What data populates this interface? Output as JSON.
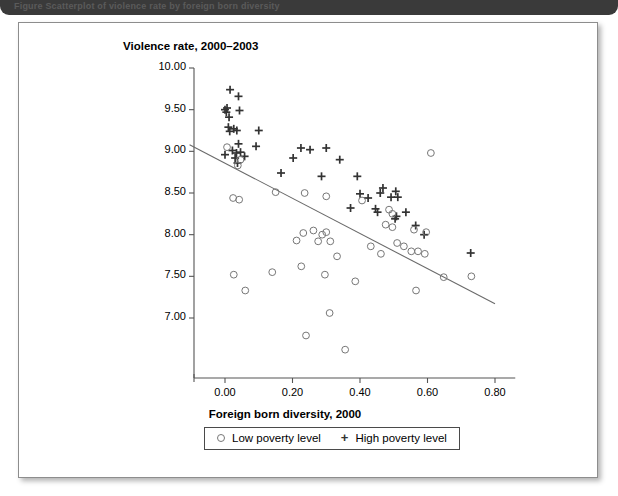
{
  "banner": {
    "caption": "Figure   Scatterplot of violence rate by foreign born diversity"
  },
  "chart_data": {
    "type": "scatter",
    "title": "",
    "ylabel": "Violence rate, 2000–2003",
    "xlabel": "Foreign born diversity, 2000",
    "xlim": [
      -0.1,
      0.9
    ],
    "ylim": [
      6.6,
      10.0
    ],
    "xticks": [
      "0.00",
      "0.20",
      "0.40",
      "0.60",
      "0.80"
    ],
    "xtick_values": [
      0.0,
      0.2,
      0.4,
      0.6,
      0.8
    ],
    "yticks": [
      "10.00",
      "9.50",
      "9.00",
      "8.50",
      "8.00",
      "7.50",
      "7.00"
    ],
    "ytick_values": [
      10.0,
      9.5,
      9.0,
      8.5,
      8.0,
      7.5,
      7.0
    ],
    "grid": false,
    "legend_position": "bottom",
    "trendline": {
      "label": "fitted regression line",
      "x1": -0.105,
      "y1": 9.08,
      "x2": 0.8,
      "y2": 7.17
    },
    "series": [
      {
        "name": "High poverty level",
        "marker": "plus",
        "color": "#333333",
        "points": [
          [
            0.015,
            9.74
          ],
          [
            0.04,
            9.66
          ],
          [
            0.0,
            9.5
          ],
          [
            0.006,
            9.52
          ],
          [
            0.004,
            9.47
          ],
          [
            0.043,
            9.49
          ],
          [
            0.012,
            9.41
          ],
          [
            0.01,
            9.29
          ],
          [
            0.014,
            9.24
          ],
          [
            0.026,
            9.27
          ],
          [
            0.035,
            9.25
          ],
          [
            0.1,
            9.25
          ],
          [
            0.04,
            9.09
          ],
          [
            0.092,
            9.06
          ],
          [
            0.0,
            8.96
          ],
          [
            0.022,
            9.01
          ],
          [
            0.034,
            8.98
          ],
          [
            0.046,
            8.99
          ],
          [
            0.03,
            8.92
          ],
          [
            0.058,
            8.94
          ],
          [
            0.037,
            8.86
          ],
          [
            0.225,
            9.04
          ],
          [
            0.252,
            9.02
          ],
          [
            0.3,
            9.04
          ],
          [
            0.202,
            8.92
          ],
          [
            0.34,
            8.9
          ],
          [
            0.166,
            8.74
          ],
          [
            0.286,
            8.7
          ],
          [
            0.392,
            8.7
          ],
          [
            0.4,
            8.49
          ],
          [
            0.46,
            8.5
          ],
          [
            0.468,
            8.56
          ],
          [
            0.506,
            8.52
          ],
          [
            0.424,
            8.44
          ],
          [
            0.492,
            8.45
          ],
          [
            0.512,
            8.45
          ],
          [
            0.372,
            8.32
          ],
          [
            0.446,
            8.31
          ],
          [
            0.452,
            8.27
          ],
          [
            0.508,
            8.22
          ],
          [
            0.504,
            8.19
          ],
          [
            0.536,
            8.27
          ],
          [
            0.565,
            8.11
          ],
          [
            0.59,
            8.0
          ],
          [
            0.728,
            7.78
          ]
        ]
      },
      {
        "name": "Low poverty level",
        "marker": "circle",
        "color": "#777777",
        "points": [
          [
            0.006,
            9.05
          ],
          [
            0.046,
            8.9
          ],
          [
            0.038,
            8.83
          ],
          [
            0.61,
            8.98
          ],
          [
            0.024,
            8.44
          ],
          [
            0.042,
            8.42
          ],
          [
            0.15,
            8.51
          ],
          [
            0.236,
            8.5
          ],
          [
            0.3,
            8.46
          ],
          [
            0.406,
            8.41
          ],
          [
            0.486,
            8.3
          ],
          [
            0.496,
            8.25
          ],
          [
            0.232,
            8.02
          ],
          [
            0.262,
            8.05
          ],
          [
            0.288,
            8.0
          ],
          [
            0.3,
            8.03
          ],
          [
            0.56,
            8.06
          ],
          [
            0.596,
            8.03
          ],
          [
            0.476,
            8.12
          ],
          [
            0.496,
            8.09
          ],
          [
            0.212,
            7.93
          ],
          [
            0.276,
            7.92
          ],
          [
            0.312,
            7.92
          ],
          [
            0.51,
            7.9
          ],
          [
            0.53,
            7.86
          ],
          [
            0.552,
            7.8
          ],
          [
            0.572,
            7.8
          ],
          [
            0.592,
            7.77
          ],
          [
            0.432,
            7.86
          ],
          [
            0.462,
            7.77
          ],
          [
            0.332,
            7.74
          ],
          [
            0.026,
            7.52
          ],
          [
            0.14,
            7.55
          ],
          [
            0.296,
            7.52
          ],
          [
            0.226,
            7.62
          ],
          [
            0.386,
            7.44
          ],
          [
            0.566,
            7.33
          ],
          [
            0.648,
            7.49
          ],
          [
            0.73,
            7.5
          ],
          [
            0.06,
            7.33
          ],
          [
            0.31,
            7.06
          ],
          [
            0.24,
            6.79
          ],
          [
            0.356,
            6.62
          ]
        ]
      }
    ]
  },
  "legend": {
    "low_label": "Low poverty level",
    "high_label": "High poverty level",
    "low_marker": "open-circle-marker",
    "high_marker": "plus-marker"
  }
}
